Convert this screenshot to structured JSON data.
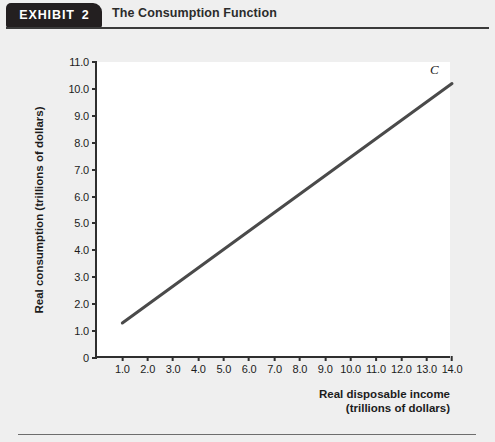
{
  "header": {
    "exhibit_word": "EXHIBIT",
    "exhibit_number": "2",
    "title": "The Consumption Function"
  },
  "chart_data": {
    "type": "line",
    "title": "The Consumption Function",
    "xlabel_line1": "Real disposable income",
    "xlabel_line2": "(trillions of dollars)",
    "ylabel": "Real consumption (trillions of dollars)",
    "xlim": [
      0,
      14
    ],
    "ylim": [
      0,
      11
    ],
    "grid": false,
    "legend": "none",
    "xticks": [
      "1.0",
      "2.0",
      "3.0",
      "4.0",
      "5.0",
      "6.0",
      "7.0",
      "8.0",
      "9.0",
      "10.0",
      "11.0",
      "12.0",
      "13.0",
      "14.0"
    ],
    "xtick_values": [
      1,
      2,
      3,
      4,
      5,
      6,
      7,
      8,
      9,
      10,
      11,
      12,
      13,
      14
    ],
    "yticks": [
      "0",
      "1.0",
      "2.0",
      "3.0",
      "4.0",
      "5.0",
      "6.0",
      "7.0",
      "8.0",
      "9.0",
      "10.0",
      "11.0"
    ],
    "ytick_values": [
      0,
      1,
      2,
      3,
      4,
      5,
      6,
      7,
      8,
      9,
      10,
      11
    ],
    "series": [
      {
        "name": "C",
        "annotation": "C",
        "color": "#4a4a4a",
        "x": [
          1,
          14
        ],
        "y": [
          1.3,
          10.2
        ]
      }
    ]
  },
  "colors": {
    "page_background": "#efefef",
    "plot_background": "#ffffff",
    "axis": "#2f2f2f",
    "line": "#4a4a4a",
    "tab_background": "#231f20"
  }
}
